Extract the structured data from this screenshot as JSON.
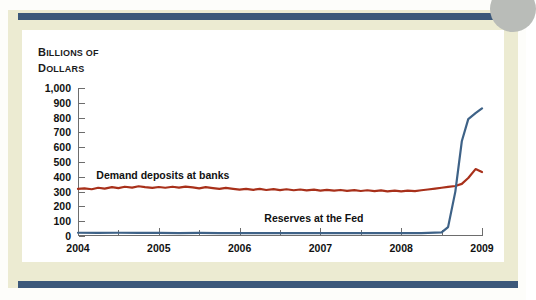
{
  "figure": {
    "axis_title_line1": "BILLIONS OF",
    "axis_title_line2": "DOLLARS",
    "accent_navy": "#3c587a",
    "mat_color": "#ecebd2",
    "disc_color": "#b9bcb8"
  },
  "chart_data": {
    "type": "line",
    "title": "",
    "xlabel": "",
    "ylabel": "Billions of dollars",
    "xlim": [
      2004,
      2009
    ],
    "ylim": [
      0,
      1000
    ],
    "ytick_labels": [
      "1,000",
      "900",
      "800",
      "700",
      "600",
      "500",
      "400",
      "300",
      "200",
      "100",
      "0"
    ],
    "ytick_values": [
      1000,
      900,
      800,
      700,
      600,
      500,
      400,
      300,
      200,
      100,
      0
    ],
    "xtick_labels": [
      "2004",
      "2005",
      "2006",
      "2007",
      "2008",
      "2009"
    ],
    "xtick_values": [
      2004,
      2005,
      2006,
      2007,
      2008,
      2009
    ],
    "xminor_values": [
      2004.5,
      2005.5,
      2006.5,
      2007.5,
      2008.5
    ],
    "grid": false,
    "legend": "inline-labels",
    "series": [
      {
        "name": "Demand deposits at banks",
        "color": "#a8301a",
        "label_x": 2005.05,
        "label_y": 415,
        "x": [
          2004.0,
          2004.08,
          2004.17,
          2004.25,
          2004.33,
          2004.42,
          2004.5,
          2004.58,
          2004.67,
          2004.75,
          2004.83,
          2004.92,
          2005.0,
          2005.08,
          2005.17,
          2005.25,
          2005.33,
          2005.42,
          2005.5,
          2005.58,
          2005.67,
          2005.75,
          2005.83,
          2005.92,
          2006.0,
          2006.08,
          2006.17,
          2006.25,
          2006.33,
          2006.42,
          2006.5,
          2006.58,
          2006.67,
          2006.75,
          2006.83,
          2006.92,
          2007.0,
          2007.08,
          2007.17,
          2007.25,
          2007.33,
          2007.42,
          2007.5,
          2007.58,
          2007.67,
          2007.75,
          2007.83,
          2007.92,
          2008.0,
          2008.08,
          2008.17,
          2008.25,
          2008.33,
          2008.42,
          2008.5,
          2008.58,
          2008.67,
          2008.75,
          2008.83,
          2008.92,
          2009.0
        ],
        "values": [
          318,
          322,
          316,
          326,
          320,
          330,
          324,
          333,
          327,
          336,
          330,
          325,
          331,
          326,
          333,
          327,
          334,
          328,
          322,
          330,
          324,
          318,
          325,
          319,
          313,
          319,
          312,
          318,
          311,
          317,
          310,
          316,
          309,
          314,
          308,
          313,
          307,
          312,
          306,
          311,
          305,
          310,
          304,
          309,
          303,
          308,
          302,
          307,
          302,
          307,
          303,
          309,
          314,
          320,
          326,
          332,
          338,
          352,
          392,
          452,
          432
        ]
      },
      {
        "name": "Reserves at the Fed",
        "color": "#3e6287",
        "label_x": 2006.92,
        "label_y": 120,
        "x": [
          2004.0,
          2004.25,
          2004.5,
          2004.75,
          2005.0,
          2005.25,
          2005.5,
          2005.75,
          2006.0,
          2006.25,
          2006.5,
          2006.75,
          2007.0,
          2007.25,
          2007.5,
          2007.75,
          2008.0,
          2008.25,
          2008.5,
          2008.58,
          2008.67,
          2008.75,
          2008.83,
          2008.92,
          2009.0
        ],
        "values": [
          22,
          21,
          22,
          21,
          21,
          20,
          21,
          20,
          20,
          20,
          20,
          19,
          20,
          19,
          20,
          19,
          20,
          20,
          24,
          60,
          300,
          640,
          790,
          830,
          862
        ]
      }
    ]
  }
}
